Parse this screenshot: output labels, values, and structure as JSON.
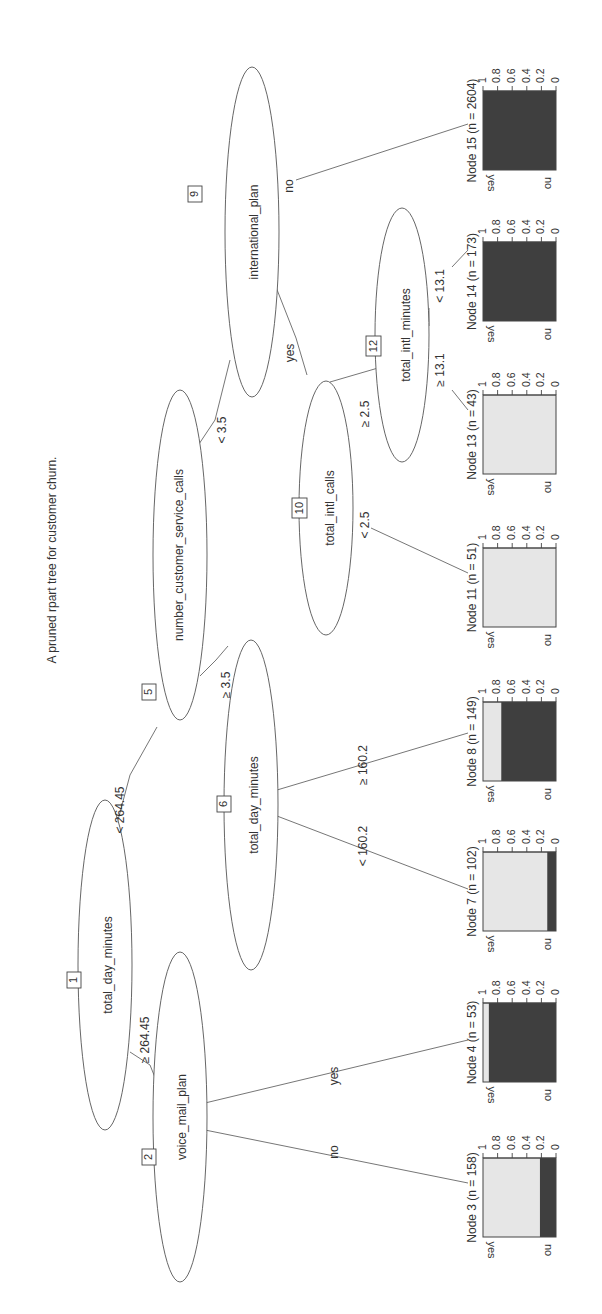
{
  "diagram": {
    "title": "A pruned rpart tree for customer churn.",
    "orientation": "rotated 90° counter-clockwise",
    "colors": {
      "yes_fill": "#e6e6e6",
      "no_fill": "#3f3f3f",
      "line": "#555555",
      "text": "#333333"
    },
    "inner_nodes": [
      {
        "id": "1",
        "variable": "total_day_minutes"
      },
      {
        "id": "2",
        "variable": "voice_mail_plan"
      },
      {
        "id": "5",
        "variable": "number_customer_service_calls"
      },
      {
        "id": "6",
        "variable": "total_day_minutes"
      },
      {
        "id": "9",
        "variable": "international_plan"
      },
      {
        "id": "10",
        "variable": "total_intl_calls"
      },
      {
        "id": "12",
        "variable": "total_intl_minutes"
      }
    ],
    "edges": [
      {
        "from": "1",
        "to": "2",
        "label": "≥ 264.45"
      },
      {
        "from": "1",
        "to": "5",
        "label": "< 264.45"
      },
      {
        "from": "2",
        "to": "3",
        "label": "no"
      },
      {
        "from": "2",
        "to": "4",
        "label": "yes"
      },
      {
        "from": "5",
        "to": "6",
        "label": "≥ 3.5"
      },
      {
        "from": "5",
        "to": "9",
        "label": "< 3.5"
      },
      {
        "from": "6",
        "to": "7",
        "label": "< 160.2"
      },
      {
        "from": "6",
        "to": "8",
        "label": "≥ 160.2"
      },
      {
        "from": "9",
        "to": "10",
        "label": "yes"
      },
      {
        "from": "9",
        "to": "15",
        "label": "no"
      },
      {
        "from": "10",
        "to": "11",
        "label": "< 2.5"
      },
      {
        "from": "10",
        "to": "12",
        "label": "≥ 2.5"
      },
      {
        "from": "12",
        "to": "13",
        "label": "≥ 13.1"
      },
      {
        "from": "12",
        "to": "14",
        "label": "< 13.1"
      }
    ],
    "terminal_nodes": [
      {
        "id": "3",
        "title": "Node 3 (n = 158)",
        "n": 158,
        "yes": 0.78,
        "no": 0.22
      },
      {
        "id": "4",
        "title": "Node 4 (n = 53)",
        "n": 53,
        "yes": 0.08,
        "no": 0.92
      },
      {
        "id": "7",
        "title": "Node 7 (n = 102)",
        "n": 102,
        "yes": 0.88,
        "no": 0.12
      },
      {
        "id": "8",
        "title": "Node 8 (n = 149)",
        "n": 149,
        "yes": 0.25,
        "no": 0.75
      },
      {
        "id": "11",
        "title": "Node 11 (n = 51)",
        "n": 51,
        "yes": 1.0,
        "no": 0.0
      },
      {
        "id": "13",
        "title": "Node 13 (n = 43)",
        "n": 43,
        "yes": 1.0,
        "no": 0.0
      },
      {
        "id": "14",
        "title": "Node 14 (n = 173)",
        "n": 173,
        "yes": 0.0,
        "no": 1.0
      },
      {
        "id": "15",
        "title": "Node 15 (n = 2604)",
        "n": 2604,
        "yes": 0.0,
        "no": 1.0
      }
    ],
    "axis_ticks": [
      "1",
      "0.8",
      "0.6",
      "0.4",
      "0.2",
      "0"
    ],
    "class_labels": [
      "yes",
      "no"
    ]
  }
}
